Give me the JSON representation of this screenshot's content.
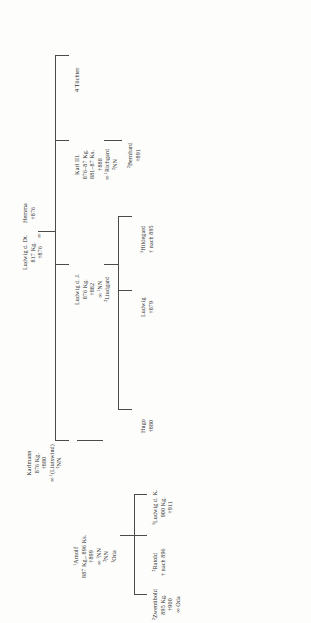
{
  "diagram": {
    "type": "genealogical-tree",
    "orientation": "rotated-90-ccw",
    "line_color": "#4a4a4a",
    "background": "#fdfdfc"
  },
  "nodes": {
    "ludwig_dt": {
      "name": "Ludwig d. Dt.",
      "l2": "817 Kg.",
      "l3": "†876"
    },
    "marriage_symbol": "∞",
    "hemma": {
      "name": "Hemma",
      "l2": "†876"
    },
    "tochter": {
      "name": "4 Töchter"
    },
    "karl3": {
      "name": "Karl III.",
      "l2": "876–87 Kg.",
      "l3": "881–87 Ks.",
      "l4": "†888",
      "l5": "∞ ¹Richgard",
      "l6": "²NN"
    },
    "bernhard": {
      "name": "²Bernhard",
      "l2": "†891"
    },
    "ludwig_j": {
      "name": "Ludwig d. J.",
      "l2": "876 Kg.",
      "l3": "†882",
      "l4": "∞ ¹NN",
      "l5": "²Liudgard"
    },
    "hildegard": {
      "name": "³Hildegard",
      "l2": "† nach 895"
    },
    "ludwig_879": {
      "name": "Ludwig",
      "l2": "†879"
    },
    "hugo": {
      "name": "Hugo",
      "l2": "†880"
    },
    "karlmann": {
      "name": "Karlmann",
      "l2": "876 Kg.",
      "l3": "†880",
      "l4": "∞ ¹(Liutswind)",
      "l5": "²NN"
    },
    "arnolf": {
      "name": "¹Arnolf",
      "l2": "887 Kg., 896 Ks.",
      "l3": "†899",
      "l4": "∞ ¹NN",
      "l5": "²NN",
      "l6": "³Oda"
    },
    "ratold": {
      "name": "²Ratold",
      "l2": "† nach 896"
    },
    "zwentibold": {
      "name": "²Zwentibold",
      "l2": "895 Kg.",
      "l3": "†900",
      "l4": "∞ Oda"
    },
    "ludwig_k": {
      "name": "³Ludwig d. K.",
      "l2": "900 Kg.",
      "l3": "†911"
    }
  }
}
